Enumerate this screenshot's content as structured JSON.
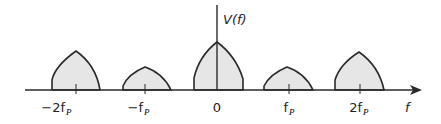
{
  "diagram": {
    "y_axis_label": "V(f)",
    "x_axis_label": "f",
    "colors": {
      "stroke": "#2a2a2a",
      "fill": "#e6e6e6",
      "background": "#ffffff"
    },
    "ticks": [
      {
        "label": "−2f",
        "sub": "P",
        "x": 76
      },
      {
        "label": "−f",
        "sub": "P",
        "x": 145
      },
      {
        "label": "0",
        "sub": "",
        "x": 217
      },
      {
        "label": "f",
        "sub": "P",
        "x": 289
      },
      {
        "label": "2f",
        "sub": "P",
        "x": 360
      }
    ],
    "lobes": [
      {
        "center": "-2fP",
        "x": 76,
        "peak_y": 51,
        "half_width": 24
      },
      {
        "center": "-fP",
        "x": 145,
        "peak_y": 67,
        "half_width": 24
      },
      {
        "center": "0",
        "x": 217,
        "peak_y": 42,
        "half_width": 24
      },
      {
        "center": "fP",
        "x": 289,
        "peak_y": 67,
        "half_width": 24
      },
      {
        "center": "2fP",
        "x": 360,
        "peak_y": 51,
        "half_width": 24
      }
    ]
  }
}
